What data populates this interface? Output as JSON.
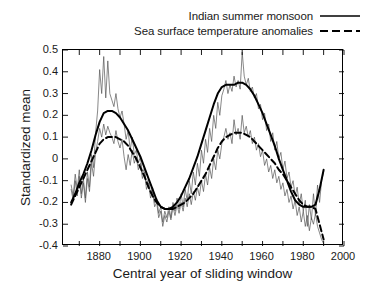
{
  "chart_data": {
    "type": "line",
    "title": "",
    "xlabel": "Central year of sliding window",
    "ylabel": "Standardized mean",
    "xlim": [
      1862,
      2000
    ],
    "ylim": [
      -0.4,
      0.5
    ],
    "xticks": [
      1880,
      1900,
      1920,
      1940,
      1960,
      1980,
      2000
    ],
    "yticks": [
      0.5,
      0.4,
      0.3,
      0.2,
      0.1,
      0,
      -0.1,
      -0.2,
      -0.3,
      -0.4
    ],
    "grid": false,
    "legend_position": "top-right",
    "legend": [
      {
        "name": "Indian summer monsoon",
        "style": "solid"
      },
      {
        "name": "Sea surface temperature anomalies",
        "style": "dashed"
      }
    ],
    "series": [
      {
        "name": "Indian summer monsoon",
        "style": "solid",
        "width": "thick",
        "color": "#000000",
        "x": [
          1866,
          1868,
          1870,
          1872,
          1874,
          1876,
          1878,
          1880,
          1882,
          1884,
          1886,
          1888,
          1890,
          1892,
          1894,
          1896,
          1898,
          1900,
          1902,
          1904,
          1906,
          1908,
          1910,
          1912,
          1914,
          1916,
          1918,
          1920,
          1922,
          1924,
          1926,
          1928,
          1930,
          1932,
          1934,
          1936,
          1938,
          1940,
          1942,
          1944,
          1946,
          1948,
          1950,
          1952,
          1954,
          1956,
          1958,
          1960,
          1962,
          1964,
          1966,
          1968,
          1970,
          1972,
          1974,
          1976,
          1978,
          1980,
          1982,
          1984,
          1986,
          1988,
          1990
        ],
        "y": [
          -0.2,
          -0.16,
          -0.11,
          -0.07,
          -0.02,
          0.04,
          0.11,
          0.17,
          0.21,
          0.22,
          0.22,
          0.21,
          0.19,
          0.16,
          0.13,
          0.09,
          0.05,
          0.01,
          -0.04,
          -0.09,
          -0.14,
          -0.19,
          -0.22,
          -0.23,
          -0.23,
          -0.22,
          -0.2,
          -0.17,
          -0.13,
          -0.09,
          -0.04,
          0.01,
          0.07,
          0.13,
          0.19,
          0.25,
          0.3,
          0.33,
          0.34,
          0.34,
          0.34,
          0.35,
          0.35,
          0.34,
          0.32,
          0.29,
          0.25,
          0.21,
          0.16,
          0.11,
          0.06,
          0.0,
          -0.05,
          -0.1,
          -0.15,
          -0.19,
          -0.21,
          -0.22,
          -0.22,
          -0.22,
          -0.21,
          -0.14,
          -0.05
        ]
      },
      {
        "name": "Sea surface temperature anomalies",
        "style": "dashed",
        "width": "thick",
        "color": "#000000",
        "x": [
          1866,
          1868,
          1870,
          1872,
          1874,
          1876,
          1878,
          1880,
          1882,
          1884,
          1886,
          1888,
          1890,
          1892,
          1894,
          1896,
          1898,
          1900,
          1902,
          1904,
          1906,
          1908,
          1910,
          1912,
          1914,
          1916,
          1918,
          1920,
          1922,
          1924,
          1926,
          1928,
          1930,
          1932,
          1934,
          1936,
          1938,
          1940,
          1942,
          1944,
          1946,
          1948,
          1950,
          1952,
          1954,
          1956,
          1958,
          1960,
          1962,
          1964,
          1966,
          1968,
          1970,
          1972,
          1974,
          1976,
          1978,
          1980,
          1982,
          1984,
          1986,
          1988,
          1990
        ],
        "y": [
          -0.21,
          -0.17,
          -0.13,
          -0.09,
          -0.05,
          -0.01,
          0.03,
          0.07,
          0.09,
          0.1,
          0.1,
          0.1,
          0.09,
          0.08,
          0.06,
          0.03,
          0.0,
          -0.04,
          -0.08,
          -0.13,
          -0.17,
          -0.2,
          -0.22,
          -0.23,
          -0.23,
          -0.23,
          -0.22,
          -0.21,
          -0.2,
          -0.18,
          -0.16,
          -0.13,
          -0.1,
          -0.07,
          -0.03,
          0.01,
          0.05,
          0.08,
          0.1,
          0.11,
          0.12,
          0.12,
          0.12,
          0.11,
          0.1,
          0.08,
          0.06,
          0.04,
          0.02,
          0.0,
          -0.02,
          -0.05,
          -0.07,
          -0.1,
          -0.13,
          -0.16,
          -0.19,
          -0.21,
          -0.22,
          -0.22,
          -0.23,
          -0.3,
          -0.37
        ]
      },
      {
        "name": "Indian summer monsoon (raw)",
        "style": "solid",
        "width": "thin",
        "color": "#555555",
        "x": [
          1866,
          1867,
          1868,
          1869,
          1870,
          1871,
          1872,
          1873,
          1874,
          1875,
          1876,
          1877,
          1878,
          1879,
          1880,
          1881,
          1882,
          1883,
          1884,
          1885,
          1886,
          1887,
          1888,
          1889,
          1890,
          1891,
          1892,
          1893,
          1894,
          1895,
          1896,
          1897,
          1898,
          1899,
          1900,
          1901,
          1902,
          1903,
          1904,
          1905,
          1906,
          1907,
          1908,
          1909,
          1910,
          1911,
          1912,
          1913,
          1914,
          1915,
          1916,
          1917,
          1918,
          1919,
          1920,
          1921,
          1922,
          1923,
          1924,
          1925,
          1926,
          1927,
          1928,
          1929,
          1930,
          1931,
          1932,
          1933,
          1934,
          1935,
          1936,
          1937,
          1938,
          1939,
          1940,
          1941,
          1942,
          1943,
          1944,
          1945,
          1946,
          1947,
          1948,
          1949,
          1950,
          1951,
          1952,
          1953,
          1954,
          1955,
          1956,
          1957,
          1958,
          1959,
          1960,
          1961,
          1962,
          1963,
          1964,
          1965,
          1966,
          1967,
          1968,
          1969,
          1970,
          1971,
          1972,
          1973,
          1974,
          1975,
          1976,
          1977,
          1978,
          1979,
          1980,
          1981,
          1982,
          1983,
          1984,
          1985,
          1986,
          1987,
          1988,
          1989,
          1990
        ],
        "y": [
          -0.12,
          -0.17,
          -0.07,
          -0.14,
          -0.05,
          -0.16,
          -0.09,
          -0.18,
          -0.06,
          -0.13,
          0.02,
          -0.04,
          0.12,
          0.22,
          0.41,
          0.3,
          0.47,
          0.28,
          0.45,
          0.3,
          0.27,
          0.24,
          0.3,
          0.23,
          0.19,
          0.22,
          0.16,
          0.09,
          0.13,
          0.04,
          0.1,
          0.02,
          0.04,
          -0.02,
          0.01,
          -0.07,
          -0.04,
          -0.12,
          -0.09,
          -0.16,
          -0.13,
          -0.2,
          -0.18,
          -0.25,
          -0.22,
          -0.29,
          -0.24,
          -0.27,
          -0.22,
          -0.27,
          -0.2,
          -0.24,
          -0.18,
          -0.23,
          -0.16,
          -0.22,
          -0.14,
          -0.19,
          -0.1,
          -0.16,
          -0.06,
          -0.12,
          -0.02,
          -0.08,
          0.04,
          -0.02,
          0.09,
          0.03,
          0.14,
          0.08,
          0.2,
          0.14,
          0.26,
          0.2,
          0.29,
          0.32,
          0.36,
          0.3,
          0.34,
          0.31,
          0.38,
          0.33,
          0.36,
          0.32,
          0.49,
          0.38,
          0.34,
          0.37,
          0.31,
          0.33,
          0.28,
          0.3,
          0.23,
          0.25,
          0.18,
          0.21,
          0.13,
          0.16,
          0.08,
          0.12,
          0.04,
          0.08,
          0.0,
          0.03,
          -0.05,
          -0.01,
          -0.09,
          -0.06,
          -0.13,
          -0.1,
          -0.17,
          -0.13,
          -0.21,
          -0.16,
          -0.24,
          -0.19,
          -0.31,
          -0.21,
          -0.28,
          -0.16,
          -0.26,
          -0.12,
          -0.2,
          -0.1,
          -0.06
        ]
      },
      {
        "name": "Sea surface temperature anomalies (raw)",
        "style": "solid",
        "width": "thin",
        "color": "#555555",
        "x": [
          1866,
          1867,
          1868,
          1869,
          1870,
          1871,
          1872,
          1873,
          1874,
          1875,
          1876,
          1877,
          1878,
          1879,
          1880,
          1881,
          1882,
          1883,
          1884,
          1885,
          1886,
          1887,
          1888,
          1889,
          1890,
          1891,
          1892,
          1893,
          1894,
          1895,
          1896,
          1897,
          1898,
          1899,
          1900,
          1901,
          1902,
          1903,
          1904,
          1905,
          1906,
          1907,
          1908,
          1909,
          1910,
          1911,
          1912,
          1913,
          1914,
          1915,
          1916,
          1917,
          1918,
          1919,
          1920,
          1921,
          1922,
          1923,
          1924,
          1925,
          1926,
          1927,
          1928,
          1929,
          1930,
          1931,
          1932,
          1933,
          1934,
          1935,
          1936,
          1937,
          1938,
          1939,
          1940,
          1941,
          1942,
          1943,
          1944,
          1945,
          1946,
          1947,
          1948,
          1949,
          1950,
          1951,
          1952,
          1953,
          1954,
          1955,
          1956,
          1957,
          1958,
          1959,
          1960,
          1961,
          1962,
          1963,
          1964,
          1965,
          1966,
          1967,
          1968,
          1969,
          1970,
          1971,
          1972,
          1973,
          1974,
          1975,
          1976,
          1977,
          1978,
          1979,
          1980,
          1981,
          1982,
          1983,
          1984,
          1985,
          1986,
          1987,
          1988,
          1989,
          1990
        ],
        "y": [
          -0.14,
          -0.19,
          -0.1,
          -0.17,
          -0.08,
          -0.18,
          -0.11,
          -0.2,
          -0.09,
          -0.15,
          -0.02,
          -0.08,
          0.03,
          0.08,
          0.14,
          0.1,
          0.16,
          0.11,
          0.15,
          0.12,
          0.1,
          0.07,
          0.13,
          0.08,
          0.05,
          0.09,
          0.01,
          -0.05,
          0.02,
          -0.03,
          0.04,
          -0.02,
          0.01,
          -0.05,
          -0.02,
          -0.09,
          -0.06,
          -0.14,
          -0.11,
          -0.18,
          -0.15,
          -0.22,
          -0.2,
          -0.27,
          -0.24,
          -0.31,
          -0.26,
          -0.29,
          -0.24,
          -0.28,
          -0.22,
          -0.26,
          -0.21,
          -0.25,
          -0.2,
          -0.24,
          -0.18,
          -0.22,
          -0.16,
          -0.21,
          -0.15,
          -0.19,
          -0.13,
          -0.17,
          -0.1,
          -0.15,
          -0.07,
          -0.12,
          -0.04,
          -0.09,
          0.0,
          -0.05,
          0.04,
          0.0,
          0.07,
          0.1,
          0.14,
          0.09,
          0.12,
          0.07,
          0.18,
          0.11,
          0.14,
          0.09,
          0.2,
          0.12,
          0.15,
          0.1,
          0.13,
          0.07,
          0.1,
          0.04,
          0.07,
          0.01,
          0.04,
          -0.03,
          0.0,
          -0.06,
          -0.03,
          -0.09,
          -0.05,
          -0.11,
          -0.08,
          -0.14,
          -0.11,
          -0.17,
          -0.14,
          -0.2,
          -0.17,
          -0.23,
          -0.19,
          -0.26,
          -0.22,
          -0.29,
          -0.24,
          -0.31,
          -0.26,
          -0.33,
          -0.27,
          -0.3,
          -0.25,
          -0.31,
          -0.34,
          -0.37,
          -0.39
        ]
      }
    ]
  },
  "axes": {
    "y_title": "Standardized mean",
    "x_title": "Central year of sliding window"
  }
}
